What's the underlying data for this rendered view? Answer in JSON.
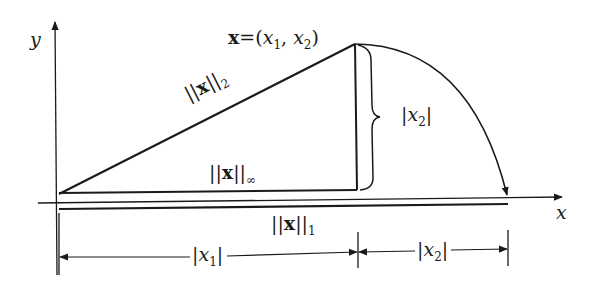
{
  "diagram": {
    "axes": {
      "x_label": "x",
      "y_label": "y"
    },
    "point": {
      "prefix": "x",
      "eq": "=(",
      "x1": "x",
      "x1_sub": "1",
      "sep": ", ",
      "x2": "x",
      "x2_sub": "2",
      "close": ")"
    },
    "labels": {
      "norm2": {
        "bars_l": "||",
        "x": "x",
        "bars_r": "||",
        "sub": "2"
      },
      "norm_inf": {
        "bars_l": "||",
        "x": "x",
        "bars_r": "||",
        "sub": "∞"
      },
      "norm1": {
        "bars_l": "||",
        "x": "x",
        "bars_r": "||",
        "sub": "1"
      },
      "abs_x2_brace": {
        "l": "|",
        "v": "x",
        "sub": "2",
        "r": "|"
      },
      "abs_x1_dim": {
        "l": "|",
        "v": "x",
        "sub": "1",
        "r": "|"
      },
      "abs_x2_dim": {
        "l": "|",
        "v": "x",
        "sub": "2",
        "r": "|"
      }
    },
    "colors": {
      "ink": "#1a1a1a",
      "background": "#ffffff"
    }
  }
}
